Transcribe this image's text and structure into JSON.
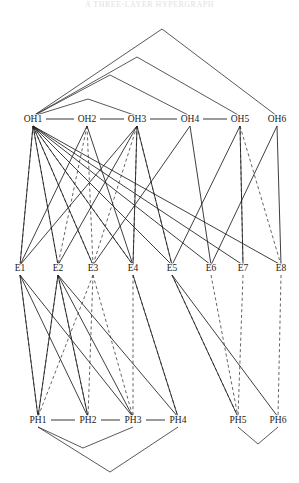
{
  "figure": {
    "top_caption": "A THREE-LAYER HYPERGRAPH",
    "background_color": "#ffffff",
    "solid_edge_color": "#1c1c1c",
    "dashed_edge_color": "#4a4a4a",
    "label_color": "#1a1a1a",
    "width": 299,
    "height": 483
  },
  "layers": [
    {
      "id": "OH",
      "name": "OH layer",
      "y": 122,
      "nodes": [
        {
          "id": "OH1",
          "label": "OH1",
          "x": 33,
          "y": 122
        },
        {
          "id": "OH2",
          "label": "OH2",
          "x": 87,
          "y": 122
        },
        {
          "id": "OH3",
          "label": "OH3",
          "x": 137,
          "y": 122
        },
        {
          "id": "OH4",
          "label": "OH4",
          "x": 190,
          "y": 122
        },
        {
          "id": "OH5",
          "label": "OH5",
          "x": 240,
          "y": 122
        },
        {
          "id": "OH6",
          "label": "OH6",
          "x": 277,
          "y": 122
        }
      ]
    },
    {
      "id": "E",
      "name": "E layer",
      "y": 271,
      "nodes": [
        {
          "id": "E1",
          "label": "E1",
          "x": 20,
          "y": 271
        },
        {
          "id": "E2",
          "label": "E2",
          "x": 58,
          "y": 271
        },
        {
          "id": "E3",
          "label": "E3",
          "x": 93,
          "y": 271
        },
        {
          "id": "E4",
          "label": "E4",
          "x": 133,
          "y": 271
        },
        {
          "id": "E5",
          "label": "E5",
          "x": 172,
          "y": 271
        },
        {
          "id": "E6",
          "label": "E6",
          "x": 211,
          "y": 271
        },
        {
          "id": "E7",
          "label": "E7",
          "x": 243,
          "y": 271
        },
        {
          "id": "E8",
          "label": "E8",
          "x": 281,
          "y": 271
        }
      ]
    },
    {
      "id": "PH",
      "name": "PH layer",
      "y": 423,
      "nodes": [
        {
          "id": "PH1",
          "label": "PH1",
          "x": 38,
          "y": 423
        },
        {
          "id": "PH2",
          "label": "PH2",
          "x": 88,
          "y": 423
        },
        {
          "id": "PH3",
          "label": "PH3",
          "x": 133,
          "y": 423
        },
        {
          "id": "PH4",
          "label": "PH4",
          "x": 178,
          "y": 423
        },
        {
          "id": "PH5",
          "label": "PH5",
          "x": 238,
          "y": 423
        },
        {
          "id": "PH6",
          "label": "PH6",
          "x": 278,
          "y": 423
        }
      ]
    }
  ],
  "chain_edges": [
    {
      "from": "OH1",
      "to": "OH2"
    },
    {
      "from": "OH2",
      "to": "OH3"
    },
    {
      "from": "OH3",
      "to": "OH4"
    },
    {
      "from": "OH4",
      "to": "OH5"
    },
    {
      "from": "PH1",
      "to": "PH2"
    },
    {
      "from": "PH2",
      "to": "PH3"
    },
    {
      "from": "PH3",
      "to": "PH4"
    }
  ],
  "top_arcs": [
    {
      "from": "OH1",
      "to": "OH6",
      "apex_x": 162,
      "apex_y": 29
    },
    {
      "from": "OH1",
      "to": "OH5",
      "apex_x": 137,
      "apex_y": 57
    },
    {
      "from": "OH1",
      "to": "OH4",
      "apex_x": 110,
      "apex_y": 75
    },
    {
      "from": "OH1",
      "to": "OH3",
      "apex_x": 88,
      "apex_y": 99
    }
  ],
  "bottom_arcs": [
    {
      "from": "PH1",
      "to": "PH4",
      "apex_x": 110,
      "apex_y": 472
    },
    {
      "from": "PH1",
      "to": "PH3",
      "apex_x": 83,
      "apex_y": 448
    },
    {
      "from": "PH5",
      "to": "PH6",
      "apex_x": 258,
      "apex_y": 444
    }
  ],
  "oh_e_edges_solid": [
    {
      "from": "OH1",
      "to": "E1"
    },
    {
      "from": "OH1",
      "to": "E2"
    },
    {
      "from": "OH1",
      "to": "E3"
    },
    {
      "from": "OH1",
      "to": "E4"
    },
    {
      "from": "OH1",
      "to": "E5"
    },
    {
      "from": "OH1",
      "to": "E6"
    },
    {
      "from": "OH1",
      "to": "E7"
    },
    {
      "from": "OH1",
      "to": "E8"
    },
    {
      "from": "OH2",
      "to": "E1"
    },
    {
      "from": "OH2",
      "to": "E4"
    },
    {
      "from": "OH3",
      "to": "E1"
    },
    {
      "from": "OH3",
      "to": "E2"
    },
    {
      "from": "OH3",
      "to": "E4"
    },
    {
      "from": "OH3",
      "to": "E5"
    },
    {
      "from": "OH4",
      "to": "E3"
    },
    {
      "from": "OH4",
      "to": "E6"
    },
    {
      "from": "OH5",
      "to": "E5"
    },
    {
      "from": "OH5",
      "to": "E7"
    },
    {
      "from": "OH6",
      "to": "E6"
    },
    {
      "from": "OH6",
      "to": "E8"
    }
  ],
  "oh_e_edges_dashed": [
    {
      "from": "OH1",
      "to": "E1"
    },
    {
      "from": "OH1",
      "to": "E2"
    },
    {
      "from": "OH1",
      "to": "E3"
    },
    {
      "from": "OH1",
      "to": "E4"
    },
    {
      "from": "OH2",
      "to": "E2"
    },
    {
      "from": "OH2",
      "to": "E3"
    },
    {
      "from": "OH3",
      "to": "E3"
    },
    {
      "from": "OH3",
      "to": "E4"
    },
    {
      "from": "OH3",
      "to": "E5"
    },
    {
      "from": "OH5",
      "to": "E7"
    },
    {
      "from": "OH5",
      "to": "E8"
    }
  ],
  "e_ph_edges_solid": [
    {
      "from": "E1",
      "to": "PH1"
    },
    {
      "from": "E1",
      "to": "PH2"
    },
    {
      "from": "E1",
      "to": "PH3"
    },
    {
      "from": "E2",
      "to": "PH1"
    },
    {
      "from": "E2",
      "to": "PH2"
    },
    {
      "from": "E2",
      "to": "PH3"
    },
    {
      "from": "E2",
      "to": "PH4"
    },
    {
      "from": "E4",
      "to": "PH4"
    },
    {
      "from": "E5",
      "to": "PH5"
    },
    {
      "from": "E5",
      "to": "PH6"
    }
  ],
  "e_ph_edges_dashed": [
    {
      "from": "E1",
      "to": "PH1"
    },
    {
      "from": "E2",
      "to": "PH1"
    },
    {
      "from": "E2",
      "to": "PH2"
    },
    {
      "from": "E3",
      "to": "PH1"
    },
    {
      "from": "E3",
      "to": "PH2"
    },
    {
      "from": "E3",
      "to": "PH3"
    },
    {
      "from": "E4",
      "to": "PH3"
    },
    {
      "from": "E4",
      "to": "PH4"
    },
    {
      "from": "E5",
      "to": "PH5"
    },
    {
      "from": "E6",
      "to": "PH5"
    },
    {
      "from": "E7",
      "to": "PH5"
    },
    {
      "from": "E8",
      "to": "PH6"
    }
  ],
  "oh_e_peaks": [
    {
      "left": "E1",
      "apex_x": 87,
      "to": "E3"
    },
    {
      "left": "E2",
      "apex_x": 137,
      "to": "E4"
    },
    {
      "left": "E4",
      "apex_x": 190,
      "to": "E6"
    },
    {
      "left": "E5",
      "apex_x": 240,
      "to": "E7"
    },
    {
      "left": "E6",
      "apex_x": 277,
      "to": "E8"
    }
  ]
}
